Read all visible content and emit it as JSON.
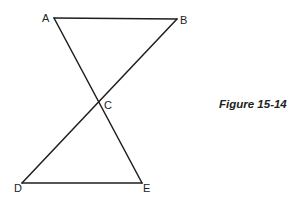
{
  "figure": {
    "caption": "Figure 15-14",
    "stroke_color": "#1e1e1e",
    "points": {
      "A": {
        "label": "A",
        "x": 54,
        "y": 18
      },
      "B": {
        "label": "B",
        "x": 177,
        "y": 19
      },
      "C": {
        "label": "C",
        "x": 101,
        "y": 101
      },
      "D": {
        "label": "D",
        "x": 22,
        "y": 183
      },
      "E": {
        "label": "E",
        "x": 142,
        "y": 183
      }
    },
    "segments": [
      {
        "from": "A",
        "to": "B"
      },
      {
        "from": "A",
        "to": "E"
      },
      {
        "from": "B",
        "to": "D"
      },
      {
        "from": "D",
        "to": "E"
      }
    ]
  }
}
